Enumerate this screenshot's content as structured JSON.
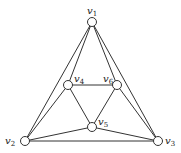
{
  "diagram": {
    "type": "graph",
    "vertices": [
      {
        "id": "v1",
        "label": "v",
        "sub": "1",
        "x": 92,
        "y": 22,
        "lx": 87,
        "ly": 14
      },
      {
        "id": "v2",
        "label": "v",
        "sub": "2",
        "x": 25,
        "y": 141,
        "lx": 5,
        "ly": 144
      },
      {
        "id": "v3",
        "label": "v",
        "sub": "3",
        "x": 158,
        "y": 141,
        "lx": 165,
        "ly": 144
      },
      {
        "id": "v4",
        "label": "v",
        "sub": "4",
        "x": 68,
        "y": 85,
        "lx": 74,
        "ly": 82
      },
      {
        "id": "v5",
        "label": "v",
        "sub": "5",
        "x": 92,
        "y": 127,
        "lx": 98,
        "ly": 125
      },
      {
        "id": "v6",
        "label": "v",
        "sub": "6",
        "x": 117,
        "y": 85,
        "lx": 103,
        "ly": 82
      }
    ],
    "edges": [
      [
        "v1",
        "v2"
      ],
      [
        "v1",
        "v3"
      ],
      [
        "v2",
        "v3"
      ],
      [
        "v1",
        "v4"
      ],
      [
        "v1",
        "v6"
      ],
      [
        "v4",
        "v6"
      ],
      [
        "v4",
        "v5"
      ],
      [
        "v6",
        "v5"
      ],
      [
        "v4",
        "v2"
      ],
      [
        "v6",
        "v3"
      ],
      [
        "v5",
        "v2"
      ],
      [
        "v5",
        "v3"
      ]
    ]
  }
}
